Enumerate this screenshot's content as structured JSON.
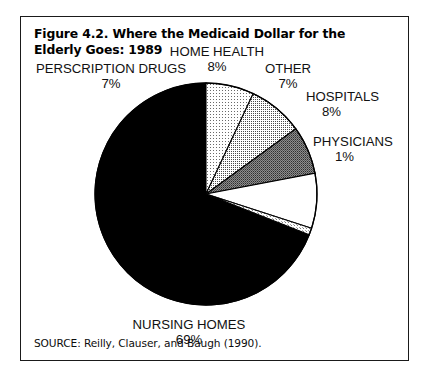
{
  "figure": {
    "title": "Figure 4.2. Where the Medicaid Dollar for the Elderly Goes: 1989",
    "source": "SOURCE: Reilly, Clauser, and Baugh (1990)."
  },
  "chart_data": {
    "type": "pie",
    "title": "Figure 4.2. Where the Medicaid Dollar for the Elderly Goes: 1989",
    "xlabel": "",
    "ylabel": "",
    "units": "percent",
    "total": 100,
    "start_angle_deg": 0,
    "direction": "clockwise",
    "legend": "none (direct labels)",
    "categories": [
      "PERSCRIPTION DRUGS",
      "HOME HEALTH",
      "OTHER",
      "HOSPITALS",
      "PHYSICIANS",
      "NURSING HOMES"
    ],
    "values": [
      7,
      8,
      7,
      8,
      1,
      69
    ],
    "labels": [
      "7%",
      "8%",
      "7%",
      "8%",
      "1%",
      "69%"
    ],
    "colors": [
      "#d8d8d8",
      "#a8a8a8",
      "#888888",
      "#ffffff",
      "#d0d0d0",
      "#000000"
    ],
    "slices": [
      {
        "name": "PERSCRIPTION DRUGS",
        "value": 7,
        "label": "7%",
        "color": "#d8d8d8",
        "order": 1
      },
      {
        "name": "HOME HEALTH",
        "value": 8,
        "label": "8%",
        "color": "#a8a8a8",
        "order": 2
      },
      {
        "name": "OTHER",
        "value": 7,
        "label": "7%",
        "color": "#888888",
        "order": 3
      },
      {
        "name": "HOSPITALS",
        "value": 8,
        "label": "8%",
        "color": "#ffffff",
        "order": 4
      },
      {
        "name": "PHYSICIANS",
        "value": 1,
        "label": "1%",
        "color": "#d0d0d0",
        "order": 5
      },
      {
        "name": "NURSING HOMES",
        "value": 69,
        "label": "69%",
        "color": "#000000",
        "order": 6
      }
    ]
  }
}
